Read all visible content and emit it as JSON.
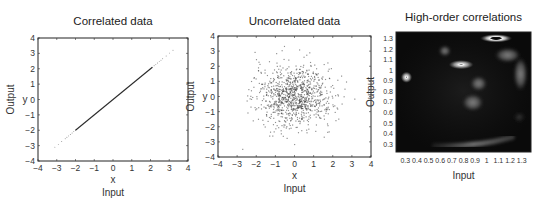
{
  "figure": {
    "panels": [
      {
        "id": "correlated",
        "title": "Correlated data",
        "xlabel": "x",
        "ylabel": "y",
        "outer_xlabel": "Input",
        "outer_ylabel": "Output",
        "box": {
          "left": 38,
          "top": 38,
          "right": 188,
          "bottom": 161
        },
        "xlim": [
          -4,
          4
        ],
        "ylim": [
          -4,
          4
        ],
        "xticks": [
          "-4",
          "-3",
          "-2",
          "-1",
          "0",
          "1",
          "2",
          "3",
          "4"
        ],
        "yticks": [
          "-4",
          "-3",
          "-2",
          "-1",
          "0",
          "1",
          "2",
          "3",
          "4"
        ]
      },
      {
        "id": "uncorrelated",
        "title": "Uncorrelated data",
        "xlabel": "x",
        "ylabel": "y",
        "outer_xlabel": "Input",
        "outer_ylabel": "Output",
        "box": {
          "left": 218,
          "top": 36,
          "right": 371,
          "bottom": 157
        },
        "xlim": [
          -4,
          4
        ],
        "ylim": [
          -4,
          4
        ],
        "xticks": [
          "-4",
          "-3",
          "-2",
          "-1",
          "0",
          "1",
          "2",
          "3",
          "4"
        ],
        "yticks": [
          "-4",
          "-3",
          "-2",
          "-1",
          "0",
          "1",
          "2",
          "3",
          "4"
        ]
      },
      {
        "id": "high-order",
        "title": "High-order correlations",
        "outer_xlabel": "Input",
        "outer_ylabel": "Output",
        "box": {
          "left": 396,
          "top": 32,
          "right": 531,
          "bottom": 152
        },
        "xlim": [
          0.22,
          1.38
        ],
        "ylim": [
          0.22,
          1.36
        ],
        "xticks": [
          "0.3",
          "0.4",
          "0.5",
          "0.6",
          "0.7",
          "0.8",
          "0.9",
          "1",
          "1.1",
          "1.2",
          "1.3"
        ],
        "yticks": [
          "0.3",
          "0.4",
          "0.5",
          "0.6",
          "0.7",
          "0.8",
          "0.9",
          "1",
          "1.1",
          "1.2",
          "1.3"
        ]
      }
    ]
  },
  "chart_data": [
    {
      "type": "line",
      "title": "Correlated data",
      "xlabel": "x (Input)",
      "ylabel": "y (Output)",
      "xlim": [
        -4,
        4
      ],
      "ylim": [
        -4,
        4
      ],
      "grid": false,
      "series": [
        {
          "name": "y = x",
          "x": [
            -3.1,
            -2.0,
            2.1,
            3.2
          ],
          "y": [
            -3.1,
            -2.0,
            2.1,
            3.2
          ],
          "solid_range": [
            -2.0,
            2.1
          ],
          "sparse_dots_outside": true
        }
      ],
      "color": "#333333"
    },
    {
      "type": "scatter",
      "title": "Uncorrelated data",
      "xlabel": "x (Input)",
      "ylabel": "y (Output)",
      "xlim": [
        -4,
        4
      ],
      "ylim": [
        -4,
        4
      ],
      "grid": false,
      "distribution": {
        "kind": "gaussian",
        "mean": [
          0,
          0
        ],
        "std": [
          1,
          1
        ],
        "n": 1000,
        "seed": 7
      },
      "color": "#444444"
    },
    {
      "type": "heatmap",
      "title": "High-order correlations",
      "xlabel": "Input",
      "ylabel": "Output",
      "xlim": [
        0.22,
        1.38
      ],
      "ylim": [
        0.22,
        1.36
      ],
      "grid": false,
      "background": "#0a0a0a",
      "blobs": [
        {
          "x": 0.31,
          "y": 0.93,
          "rx": 0.05,
          "ry": 0.055,
          "kind": "ring"
        },
        {
          "x": 0.78,
          "y": 1.05,
          "rx": 0.11,
          "ry": 0.045,
          "kind": "ring"
        },
        {
          "x": 1.08,
          "y": 1.3,
          "rx": 0.14,
          "ry": 0.04,
          "kind": "ring-dark-core"
        },
        {
          "x": 0.64,
          "y": 1.18,
          "rx": 0.05,
          "ry": 0.05,
          "kind": "soft"
        },
        {
          "x": 0.93,
          "y": 0.87,
          "rx": 0.07,
          "ry": 0.07,
          "kind": "soft"
        },
        {
          "x": 0.88,
          "y": 0.69,
          "rx": 0.09,
          "ry": 0.08,
          "kind": "soft"
        },
        {
          "x": 1.18,
          "y": 1.14,
          "rx": 0.11,
          "ry": 0.07,
          "kind": "soft"
        },
        {
          "x": 1.29,
          "y": 0.96,
          "rx": 0.06,
          "ry": 0.16,
          "kind": "soft"
        },
        {
          "x": 1.28,
          "y": 0.55,
          "rx": 0.05,
          "ry": 0.05,
          "kind": "faint"
        }
      ],
      "arc": {
        "x0": 0.55,
        "y0": 0.28,
        "x1": 1.22,
        "y1": 0.36,
        "kind": "soft"
      }
    }
  ]
}
